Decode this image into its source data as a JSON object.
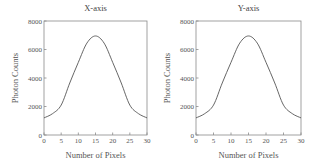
{
  "chart_data": [
    {
      "type": "line",
      "title": "X-axis",
      "xlabel": "Number of Pixels",
      "ylabel": "Photon Counts",
      "xlim": [
        0,
        30
      ],
      "ylim": [
        0,
        8000
      ],
      "xticks": [
        0,
        5,
        10,
        15,
        20,
        25,
        30
      ],
      "yticks": [
        0,
        2000,
        4000,
        6000,
        8000
      ],
      "grid": false,
      "legend": null,
      "series": [
        {
          "name": "X-axis profile",
          "x": [
            0,
            2.5,
            5,
            7.5,
            10,
            12.5,
            15,
            17.5,
            20,
            22.5,
            25,
            27.5,
            30
          ],
          "y": [
            1200,
            1500,
            2100,
            3650,
            5100,
            6450,
            6950,
            6450,
            5100,
            3650,
            2100,
            1500,
            1200
          ]
        }
      ]
    },
    {
      "type": "line",
      "title": "Y-axis",
      "xlabel": "Number of Pixels",
      "ylabel": "Photon Counts",
      "xlim": [
        0,
        30
      ],
      "ylim": [
        0,
        8000
      ],
      "xticks": [
        0,
        5,
        10,
        15,
        20,
        25,
        30
      ],
      "yticks": [
        0,
        2000,
        4000,
        6000,
        8000
      ],
      "grid": false,
      "legend": null,
      "series": [
        {
          "name": "Y-axis profile",
          "x": [
            0,
            2.5,
            5,
            7.5,
            10,
            12.5,
            15,
            17.5,
            20,
            22.5,
            25,
            27.5,
            30
          ],
          "y": [
            1200,
            1500,
            2100,
            3650,
            5100,
            6450,
            6950,
            6450,
            5100,
            3650,
            2100,
            1500,
            1200
          ]
        }
      ]
    }
  ],
  "panels": [
    {
      "title": "X-axis",
      "xlabel": "Number of Pixels",
      "ylabel": "Photon Counts"
    },
    {
      "title": "Y-axis",
      "xlabel": "Number of Pixels",
      "ylabel": "Photon Counts"
    }
  ]
}
